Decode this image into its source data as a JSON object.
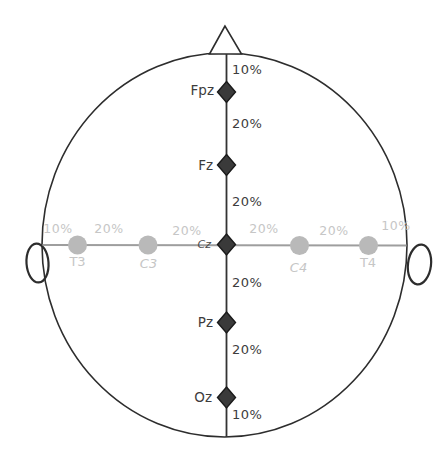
{
  "colors": {
    "background": "#ffffff",
    "outline": "#2d2d2d",
    "midline_axis": "#333333",
    "lateral_axis": "#9e9e9e",
    "dark_marker_fill": "#3a3a3a",
    "dark_marker_stroke": "#1a1a1a",
    "gray_marker_fill": "#b9b9b9",
    "dark_text": "#3d3d3d",
    "cz_text": "#4a4a4a",
    "gray_text": "#c6c6c6"
  },
  "midline_electrodes": [
    {
      "label": "Fpz"
    },
    {
      "label": "Fz"
    },
    {
      "label": "Cz"
    },
    {
      "label": "Pz"
    },
    {
      "label": "Oz"
    }
  ],
  "lateral_electrodes": [
    {
      "label": "T3"
    },
    {
      "label": "C3"
    },
    {
      "label": "C4"
    },
    {
      "label": "T4"
    }
  ],
  "midline_percents": [
    "10%",
    "20%",
    "20%",
    "20%",
    "20%",
    "10%"
  ],
  "lateral_percents": [
    "10%",
    "20%",
    "20%",
    "20%",
    "20%",
    "10%"
  ]
}
